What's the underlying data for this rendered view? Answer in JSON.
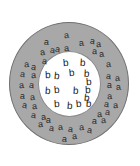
{
  "figure": {
    "width": 140,
    "height": 166,
    "background_color": "#ffffff",
    "outer_region": {
      "name": "outer-annulus",
      "shape": "circle",
      "fill_color": "#a8a8a8",
      "stroke_color": "#707070",
      "center_x": 69,
      "center_y": 83.5,
      "radius_x": 60,
      "radius_y": 61.5,
      "letter": "a",
      "letter_count": 45
    },
    "inner_region": {
      "name": "inner-disc",
      "shape": "circle",
      "fill_color": "#ffffff",
      "stroke_color": "#8a8a8a",
      "center_x": 69.5,
      "center_y": 84,
      "radius_x": 31.5,
      "radius_y": 33,
      "letter": "b",
      "letter_count": 16
    }
  },
  "outer_letters": [
    {
      "label": "a",
      "x": 64,
      "y": 31,
      "rot": -6,
      "size": 9
    },
    {
      "label": "a",
      "x": 44,
      "y": 38,
      "rot": 4,
      "size": 9
    },
    {
      "label": "a",
      "x": 79,
      "y": 39,
      "rot": -8,
      "size": 9
    },
    {
      "label": "a",
      "x": 90,
      "y": 37,
      "rot": 10,
      "size": 9
    },
    {
      "label": "a",
      "x": 96,
      "y": 40,
      "rot": -4,
      "size": 9
    },
    {
      "label": "a",
      "x": 55,
      "y": 45,
      "rot": 8,
      "size": 9
    },
    {
      "label": "a",
      "x": 64,
      "y": 44,
      "rot": -5,
      "size": 9
    },
    {
      "label": "a",
      "x": 40,
      "y": 48,
      "rot": -10,
      "size": 9
    },
    {
      "label": "a",
      "x": 50,
      "y": 46,
      "rot": 6,
      "size": 9
    },
    {
      "label": "a",
      "x": 92,
      "y": 47,
      "rot": 2,
      "size": 9
    },
    {
      "label": "a",
      "x": 99,
      "y": 50,
      "rot": -9,
      "size": 9
    },
    {
      "label": "a",
      "x": 42,
      "y": 57,
      "rot": 5,
      "size": 9
    },
    {
      "label": "a",
      "x": 24,
      "y": 60,
      "rot": -3,
      "size": 9
    },
    {
      "label": "a",
      "x": 31,
      "y": 63,
      "rot": 9,
      "size": 9
    },
    {
      "label": "a",
      "x": 106,
      "y": 60,
      "rot": -6,
      "size": 9
    },
    {
      "label": "a",
      "x": 20,
      "y": 70,
      "rot": 7,
      "size": 9
    },
    {
      "label": "a",
      "x": 31,
      "y": 71,
      "rot": -4,
      "size": 9
    },
    {
      "label": "a",
      "x": 106,
      "y": 72,
      "rot": 5,
      "size": 9
    },
    {
      "label": "a",
      "x": 115,
      "y": 74,
      "rot": -7,
      "size": 9
    },
    {
      "label": "a",
      "x": 19,
      "y": 81,
      "rot": -5,
      "size": 9
    },
    {
      "label": "a",
      "x": 29,
      "y": 81,
      "rot": 6,
      "size": 9
    },
    {
      "label": "a",
      "x": 107,
      "y": 81,
      "rot": 3,
      "size": 9
    },
    {
      "label": "a",
      "x": 116,
      "y": 83,
      "rot": -8,
      "size": 9
    },
    {
      "label": "a",
      "x": 20,
      "y": 92,
      "rot": 4,
      "size": 9
    },
    {
      "label": "a",
      "x": 30,
      "y": 93,
      "rot": -6,
      "size": 9
    },
    {
      "label": "a",
      "x": 107,
      "y": 92,
      "rot": -3,
      "size": 9
    },
    {
      "label": "a",
      "x": 22,
      "y": 101,
      "rot": 8,
      "size": 9
    },
    {
      "label": "a",
      "x": 32,
      "y": 102,
      "rot": -5,
      "size": 9
    },
    {
      "label": "a",
      "x": 104,
      "y": 100,
      "rot": 6,
      "size": 9
    },
    {
      "label": "a",
      "x": 113,
      "y": 101,
      "rot": -4,
      "size": 9
    },
    {
      "label": "a",
      "x": 31,
      "y": 111,
      "rot": 5,
      "size": 9
    },
    {
      "label": "a",
      "x": 41,
      "y": 113,
      "rot": -9,
      "size": 9
    },
    {
      "label": "a",
      "x": 46,
      "y": 116,
      "rot": 3,
      "size": 9
    },
    {
      "label": "a",
      "x": 97,
      "y": 110,
      "rot": -5,
      "size": 9
    },
    {
      "label": "a",
      "x": 105,
      "y": 108,
      "rot": 7,
      "size": 9
    },
    {
      "label": "a",
      "x": 92,
      "y": 117,
      "rot": 4,
      "size": 9
    },
    {
      "label": "a",
      "x": 101,
      "y": 116,
      "rot": -6,
      "size": 9
    },
    {
      "label": "a",
      "x": 38,
      "y": 120,
      "rot": -4,
      "size": 9
    },
    {
      "label": "a",
      "x": 49,
      "y": 124,
      "rot": 6,
      "size": 9
    },
    {
      "label": "a",
      "x": 58,
      "y": 123,
      "rot": -7,
      "size": 9
    },
    {
      "label": "a",
      "x": 68,
      "y": 125,
      "rot": 5,
      "size": 9
    },
    {
      "label": "a",
      "x": 79,
      "y": 123,
      "rot": -3,
      "size": 9
    },
    {
      "label": "a",
      "x": 87,
      "y": 126,
      "rot": 8,
      "size": 9
    },
    {
      "label": "a",
      "x": 72,
      "y": 132,
      "rot": -5,
      "size": 9
    },
    {
      "label": "a",
      "x": 62,
      "y": 135,
      "rot": 4,
      "size": 9
    }
  ],
  "inner_letters": [
    {
      "label": "b",
      "x": 63,
      "y": 58,
      "rot": -5,
      "size": 10
    },
    {
      "label": "b",
      "x": 80,
      "y": 58,
      "rot": 4,
      "size": 10
    },
    {
      "label": "b",
      "x": 45,
      "y": 70,
      "rot": -3,
      "size": 10
    },
    {
      "label": "b",
      "x": 54,
      "y": 71,
      "rot": 6,
      "size": 10
    },
    {
      "label": "b",
      "x": 69,
      "y": 68,
      "rot": -6,
      "size": 10
    },
    {
      "label": "b",
      "x": 84,
      "y": 69,
      "rot": 3,
      "size": 10
    },
    {
      "label": "b",
      "x": 86,
      "y": 77,
      "rot": -4,
      "size": 10
    },
    {
      "label": "b",
      "x": 45,
      "y": 86,
      "rot": 5,
      "size": 10
    },
    {
      "label": "b",
      "x": 54,
      "y": 85,
      "rot": -5,
      "size": 10
    },
    {
      "label": "b",
      "x": 73,
      "y": 86,
      "rot": 4,
      "size": 10
    },
    {
      "label": "b",
      "x": 85,
      "y": 85,
      "rot": -3,
      "size": 10
    },
    {
      "label": "b",
      "x": 84,
      "y": 93,
      "rot": 6,
      "size": 10
    },
    {
      "label": "b",
      "x": 54,
      "y": 99,
      "rot": -4,
      "size": 10
    },
    {
      "label": "b",
      "x": 67,
      "y": 101,
      "rot": 5,
      "size": 10
    },
    {
      "label": "b",
      "x": 76,
      "y": 99,
      "rot": -6,
      "size": 10
    },
    {
      "label": "b",
      "x": 86,
      "y": 99,
      "rot": 3,
      "size": 10
    }
  ]
}
